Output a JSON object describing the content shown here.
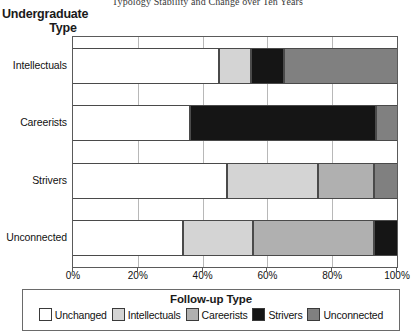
{
  "chart_data": {
    "type": "bar",
    "orientation": "horizontal",
    "stacked": true,
    "normalized": true,
    "title": "Typology Stability and Change over Ten Years",
    "xlabel": "",
    "ylabel": "Undergraduate Type",
    "ylabel_line1": "Undergraduate",
    "ylabel_line2": "Type",
    "categories": [
      "Intellectuals",
      "Careerists",
      "Strivers",
      "Unconnected"
    ],
    "xlim": [
      0,
      100
    ],
    "xticks": [
      0,
      20,
      40,
      60,
      80,
      100
    ],
    "xticklabels": [
      "0%",
      "20%",
      "40%",
      "60%",
      "80%",
      "100%"
    ],
    "grid": true,
    "legend_title": "Follow-up Type",
    "legend_position": "bottom",
    "series": [
      {
        "name": "Unchanged",
        "color": "#ffffff",
        "values": [
          45.0,
          36.0,
          47.5,
          34.0
        ]
      },
      {
        "name": "Intellectuals",
        "color": "#d4d4d4",
        "values": [
          10.0,
          0.0,
          28.0,
          21.5
        ]
      },
      {
        "name": "Careerists",
        "color": "#b0b0b0",
        "values": [
          0.0,
          0.0,
          17.5,
          37.5
        ]
      },
      {
        "name": "Strivers",
        "color": "#151515",
        "values": [
          10.0,
          57.5,
          0.0,
          7.0
        ]
      },
      {
        "name": "Unconnected",
        "color": "#808080",
        "values": [
          35.0,
          6.5,
          7.0,
          0.0
        ]
      }
    ]
  },
  "legend": {
    "title": "Follow-up Type",
    "items": [
      {
        "label": "Unchanged",
        "color": "#ffffff"
      },
      {
        "label": "Intellectuals",
        "color": "#d4d4d4"
      },
      {
        "label": "Careerists",
        "color": "#b0b0b0"
      },
      {
        "label": "Strivers",
        "color": "#151515"
      },
      {
        "label": "Unconnected",
        "color": "#808080"
      }
    ]
  }
}
